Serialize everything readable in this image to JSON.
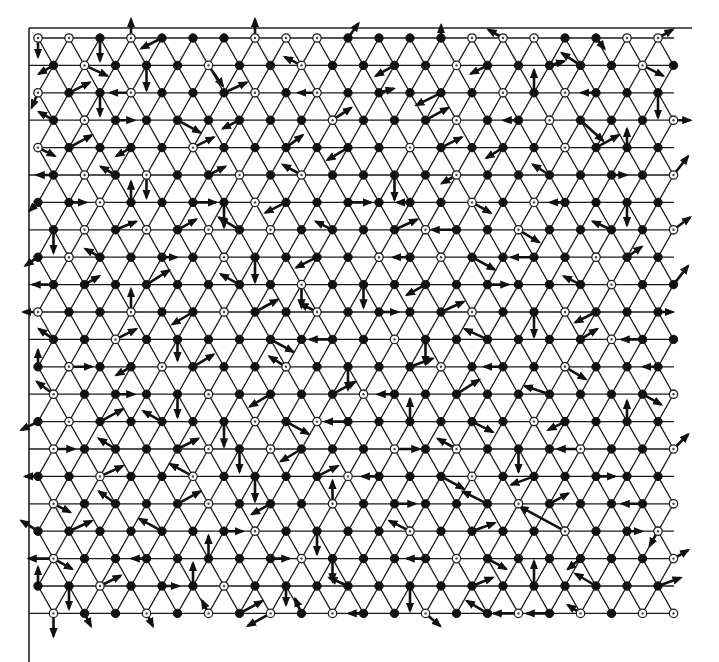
{
  "figure": {
    "title": "",
    "width": 719,
    "height": 662,
    "colors": {
      "line": "#1a1a1a",
      "arrow": "#111111",
      "background": "#ffffff"
    },
    "frame": {
      "left": 29,
      "top": 28,
      "right": 692,
      "bottom": 662
    },
    "lattice": {
      "rows": 22,
      "row0_y": 38,
      "row_spacing": 27.4,
      "col_spacing": 31,
      "even_row_x0": 38,
      "odd_row_x0": 53.5,
      "cols_per_row": 21,
      "node_radius": 4.2
    },
    "node_types": [
      "ooFoFFFoooFFFFoooFFoo",
      "FoFFFoFFoFFFFoFFFFFoF",
      "oFFoFFFoFoFFFFFoFoFFF",
      "FoFFFFFFFoFFFoFFoFFFo",
      "oFFFFoFFFFFFoFFFFoFFF",
      "FoFoFFoFoFFFFoFFFFFFo",
      "FFoFFFFoFFFFFFoFoFFFF",
      "FoFoFoFoFFFFoFFoFFFFo",
      "FoFFFFoFFFFoFoFFFFoFF",
      "FFFFFFFFoFFFFFFFFFoFF",
      "oFFoFFoFFoFFFFoFFoFFF",
      "FFoFFFFFFFFoFFFFFFoFF",
      "FoFFoFFFoFFFFoFFFoFFF",
      "oFFFFoFFFFoFFFFFFFFFo",
      "FoFFFFFoFoFFFFFFoFFFF",
      "oFFFFoFoFFFoFoFFFoFFo",
      "FFoFFoFFFFoFFFoFFFFFF",
      "oFFFFoFFFoFFFFFoFFFFo",
      "FFFFFFFoFFFFoFFFFoFFo",
      "oFFFFFFFoFFFFoFFFFFFo",
      "FFoFFFoFFFFFFFFFFFFFF",
      "oFFoFoFoFoFFoFFoFoFoo"
    ],
    "arrows": [
      [
        0,
        0,
        0,
        18
      ],
      [
        0,
        2,
        0,
        22
      ],
      [
        0,
        3,
        0,
        -18
      ],
      [
        0,
        4,
        -20,
        10
      ],
      [
        0,
        7,
        0,
        -18
      ],
      [
        0,
        10,
        10,
        -14
      ],
      [
        0,
        13,
        0,
        -12
      ],
      [
        0,
        15,
        -14,
        -8
      ],
      [
        0,
        18,
        8,
        10
      ],
      [
        0,
        20,
        14,
        -8
      ],
      [
        1,
        0,
        -14,
        8
      ],
      [
        1,
        1,
        22,
        10
      ],
      [
        1,
        3,
        0,
        24
      ],
      [
        1,
        5,
        14,
        20
      ],
      [
        1,
        8,
        -16,
        -8
      ],
      [
        1,
        11,
        -18,
        10
      ],
      [
        1,
        14,
        -16,
        8
      ],
      [
        1,
        16,
        14,
        -4
      ],
      [
        1,
        17,
        -18,
        -12
      ],
      [
        1,
        19,
        20,
        10
      ],
      [
        2,
        0,
        -6,
        14
      ],
      [
        2,
        1,
        20,
        -10
      ],
      [
        2,
        2,
        0,
        22
      ],
      [
        2,
        3,
        -20,
        0
      ],
      [
        2,
        6,
        22,
        -10
      ],
      [
        2,
        9,
        -18,
        0
      ],
      [
        2,
        11,
        14,
        -4
      ],
      [
        2,
        13,
        -24,
        12
      ],
      [
        2,
        16,
        0,
        -22
      ],
      [
        2,
        18,
        -14,
        0
      ],
      [
        2,
        20,
        0,
        24
      ],
      [
        3,
        0,
        -14,
        -8
      ],
      [
        3,
        2,
        18,
        0
      ],
      [
        3,
        4,
        22,
        12
      ],
      [
        3,
        6,
        -16,
        8
      ],
      [
        3,
        9,
        18,
        -12
      ],
      [
        3,
        12,
        22,
        -12
      ],
      [
        3,
        15,
        -14,
        0
      ],
      [
        3,
        17,
        22,
        20
      ],
      [
        3,
        20,
        16,
        0
      ],
      [
        4,
        0,
        16,
        8
      ],
      [
        4,
        1,
        22,
        -12
      ],
      [
        4,
        3,
        -14,
        8
      ],
      [
        4,
        5,
        20,
        -10
      ],
      [
        4,
        8,
        16,
        -12
      ],
      [
        4,
        10,
        -20,
        12
      ],
      [
        4,
        13,
        20,
        -10
      ],
      [
        4,
        15,
        -16,
        10
      ],
      [
        4,
        18,
        22,
        -12
      ],
      [
        4,
        19,
        0,
        -18
      ],
      [
        5,
        0,
        -16,
        0
      ],
      [
        5,
        2,
        -14,
        -8
      ],
      [
        5,
        3,
        0,
        22
      ],
      [
        5,
        5,
        16,
        -8
      ],
      [
        5,
        8,
        -18,
        -10
      ],
      [
        5,
        11,
        0,
        24
      ],
      [
        5,
        13,
        -14,
        8
      ],
      [
        5,
        16,
        -16,
        -10
      ],
      [
        5,
        18,
        14,
        0
      ],
      [
        5,
        20,
        14,
        -18
      ],
      [
        6,
        0,
        -8,
        8
      ],
      [
        6,
        1,
        16,
        0
      ],
      [
        6,
        3,
        0,
        -20
      ],
      [
        6,
        5,
        22,
        0
      ],
      [
        6,
        6,
        0,
        24
      ],
      [
        6,
        8,
        -20,
        10
      ],
      [
        6,
        10,
        22,
        0
      ],
      [
        6,
        12,
        -12,
        0
      ],
      [
        6,
        14,
        18,
        10
      ],
      [
        6,
        17,
        -14,
        0
      ],
      [
        6,
        19,
        0,
        22
      ],
      [
        7,
        0,
        0,
        22
      ],
      [
        7,
        2,
        20,
        -8
      ],
      [
        7,
        4,
        18,
        -10
      ],
      [
        7,
        6,
        -20,
        -12
      ],
      [
        7,
        9,
        -16,
        -8
      ],
      [
        7,
        11,
        22,
        -10
      ],
      [
        7,
        13,
        -24,
        0
      ],
      [
        7,
        15,
        20,
        12
      ],
      [
        7,
        18,
        -18,
        -8
      ],
      [
        7,
        20,
        16,
        -12
      ],
      [
        8,
        0,
        -12,
        8
      ],
      [
        8,
        2,
        -14,
        -8
      ],
      [
        8,
        4,
        14,
        0
      ],
      [
        8,
        7,
        0,
        24
      ],
      [
        8,
        9,
        -20,
        10
      ],
      [
        8,
        12,
        -16,
        0
      ],
      [
        8,
        14,
        22,
        12
      ],
      [
        8,
        16,
        -22,
        0
      ],
      [
        8,
        19,
        14,
        -10
      ],
      [
        9,
        0,
        -20,
        0
      ],
      [
        9,
        1,
        14,
        -8
      ],
      [
        9,
        3,
        22,
        -14
      ],
      [
        9,
        6,
        -18,
        -10
      ],
      [
        9,
        8,
        0,
        22
      ],
      [
        9,
        10,
        0,
        22
      ],
      [
        9,
        12,
        -18,
        10
      ],
      [
        9,
        14,
        20,
        0
      ],
      [
        9,
        17,
        -16,
        -8
      ],
      [
        9,
        20,
        14,
        -18
      ],
      [
        10,
        0,
        -14,
        0
      ],
      [
        10,
        3,
        0,
        -22
      ],
      [
        10,
        5,
        -20,
        12
      ],
      [
        10,
        7,
        22,
        -12
      ],
      [
        10,
        9,
        -16,
        -8
      ],
      [
        10,
        11,
        18,
        0
      ],
      [
        10,
        13,
        22,
        -10
      ],
      [
        10,
        16,
        0,
        24
      ],
      [
        10,
        18,
        -20,
        10
      ],
      [
        10,
        20,
        14,
        0
      ],
      [
        11,
        0,
        -14,
        -10
      ],
      [
        11,
        2,
        20,
        -10
      ],
      [
        11,
        4,
        0,
        20
      ],
      [
        11,
        7,
        22,
        12
      ],
      [
        11,
        9,
        -22,
        0
      ],
      [
        11,
        12,
        0,
        24
      ],
      [
        11,
        14,
        -22,
        -10
      ],
      [
        11,
        17,
        16,
        -10
      ],
      [
        11,
        19,
        -20,
        0
      ],
      [
        12,
        0,
        0,
        -16
      ],
      [
        12,
        1,
        22,
        0
      ],
      [
        12,
        3,
        -14,
        8
      ],
      [
        12,
        5,
        20,
        -12
      ],
      [
        12,
        8,
        -16,
        -10
      ],
      [
        12,
        10,
        0,
        22
      ],
      [
        12,
        12,
        22,
        -8
      ],
      [
        12,
        15,
        -18,
        0
      ],
      [
        12,
        17,
        20,
        12
      ],
      [
        12,
        20,
        -14,
        0
      ],
      [
        13,
        0,
        -16,
        -12
      ],
      [
        13,
        2,
        18,
        0
      ],
      [
        13,
        4,
        0,
        22
      ],
      [
        13,
        7,
        -20,
        12
      ],
      [
        13,
        9,
        22,
        -12
      ],
      [
        13,
        11,
        -16,
        0
      ],
      [
        13,
        13,
        22,
        -14
      ],
      [
        13,
        16,
        -24,
        -8
      ],
      [
        13,
        19,
        18,
        10
      ],
      [
        14,
        0,
        -16,
        8
      ],
      [
        14,
        2,
        22,
        -12
      ],
      [
        14,
        4,
        -18,
        -10
      ],
      [
        14,
        6,
        0,
        24
      ],
      [
        14,
        8,
        22,
        12
      ],
      [
        14,
        10,
        -22,
        0
      ],
      [
        14,
        12,
        0,
        -22
      ],
      [
        14,
        14,
        20,
        10
      ],
      [
        14,
        17,
        -16,
        8
      ],
      [
        14,
        19,
        0,
        -20
      ],
      [
        15,
        0,
        20,
        0
      ],
      [
        15,
        2,
        -16,
        -10
      ],
      [
        15,
        4,
        20,
        -10
      ],
      [
        15,
        6,
        0,
        22
      ],
      [
        15,
        8,
        -20,
        12
      ],
      [
        15,
        11,
        24,
        0
      ],
      [
        15,
        13,
        -18,
        -10
      ],
      [
        15,
        15,
        0,
        22
      ],
      [
        15,
        17,
        -22,
        0
      ],
      [
        15,
        20,
        14,
        -14
      ],
      [
        16,
        0,
        -12,
        0
      ],
      [
        16,
        2,
        22,
        -10
      ],
      [
        16,
        5,
        -22,
        -12
      ],
      [
        16,
        7,
        0,
        24
      ],
      [
        16,
        9,
        20,
        -10
      ],
      [
        16,
        11,
        -16,
        0
      ],
      [
        16,
        13,
        22,
        12
      ],
      [
        16,
        16,
        -22,
        8
      ],
      [
        16,
        18,
        18,
        0
      ],
      [
        17,
        0,
        16,
        8
      ],
      [
        17,
        2,
        -16,
        -12
      ],
      [
        17,
        4,
        22,
        -12
      ],
      [
        17,
        7,
        -18,
        10
      ],
      [
        17,
        9,
        0,
        -22
      ],
      [
        17,
        11,
        20,
        0
      ],
      [
        17,
        14,
        -24,
        -12
      ],
      [
        17,
        16,
        18,
        -10
      ],
      [
        17,
        19,
        -20,
        0
      ],
      [
        18,
        0,
        -16,
        -10
      ],
      [
        18,
        1,
        22,
        -10
      ],
      [
        18,
        4,
        -22,
        -12
      ],
      [
        18,
        6,
        18,
        0
      ],
      [
        18,
        9,
        0,
        22
      ],
      [
        18,
        12,
        -20,
        -10
      ],
      [
        18,
        14,
        22,
        -8
      ],
      [
        18,
        17,
        -44,
        -24
      ],
      [
        18,
        19,
        14,
        0
      ],
      [
        18,
        20,
        -8,
        14
      ],
      [
        19,
        0,
        -24,
        0
      ],
      [
        19,
        0,
        18,
        10
      ],
      [
        19,
        3,
        -14,
        0
      ],
      [
        19,
        5,
        0,
        -22
      ],
      [
        19,
        7,
        18,
        0
      ],
      [
        19,
        9,
        0,
        22
      ],
      [
        19,
        12,
        -18,
        0
      ],
      [
        19,
        14,
        18,
        10
      ],
      [
        19,
        17,
        -12,
        10
      ],
      [
        19,
        20,
        14,
        -8
      ],
      [
        20,
        0,
        0,
        -18
      ],
      [
        20,
        1,
        0,
        22
      ],
      [
        20,
        2,
        20,
        -10
      ],
      [
        20,
        4,
        16,
        0
      ],
      [
        20,
        5,
        0,
        -22
      ],
      [
        20,
        8,
        0,
        18
      ],
      [
        20,
        10,
        -18,
        -8
      ],
      [
        20,
        12,
        0,
        24
      ],
      [
        20,
        14,
        20,
        -8
      ],
      [
        20,
        16,
        0,
        -24
      ],
      [
        20,
        18,
        -20,
        -12
      ],
      [
        20,
        20,
        22,
        -8
      ],
      [
        21,
        0,
        0,
        22
      ],
      [
        21,
        1,
        6,
        12
      ],
      [
        21,
        3,
        6,
        12
      ],
      [
        21,
        5,
        -6,
        -12
      ],
      [
        21,
        6,
        22,
        -12
      ],
      [
        21,
        7,
        -22,
        12
      ],
      [
        21,
        8,
        -6,
        -14
      ],
      [
        21,
        10,
        -14,
        0
      ],
      [
        21,
        12,
        14,
        12
      ],
      [
        21,
        14,
        -20,
        -12
      ],
      [
        21,
        15,
        -24,
        0
      ],
      [
        21,
        16,
        -22,
        0
      ],
      [
        21,
        17,
        -12,
        -8
      ]
    ]
  }
}
